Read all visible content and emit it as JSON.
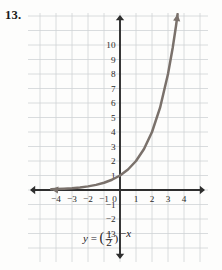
{
  "problem": {
    "number": "13."
  },
  "chart_data": {
    "type": "line",
    "title": "",
    "xlabel": "",
    "ylabel": "",
    "equation": "y = (1/2)^(-x)",
    "equation_parts": {
      "lhs": "y",
      "equals": "=",
      "open_paren": "(",
      "numerator": "1",
      "denominator": "2",
      "close_paren": ")",
      "exponent_sign": "−",
      "exponent_var": "x"
    },
    "xlim": [
      -4.6,
      5.0
    ],
    "ylim": [
      -4.6,
      11.4
    ],
    "grid": true,
    "grid_step": 1,
    "legend": "none",
    "x_ticks": [
      -4,
      -3,
      -2,
      -1,
      0,
      1,
      2,
      3,
      4
    ],
    "x_tick_labels": [
      "−4",
      "−3",
      "−2",
      "−1",
      "0",
      "1",
      "2",
      "3",
      "4"
    ],
    "y_ticks": [
      -3,
      -2,
      -1,
      1,
      2,
      3,
      4,
      5,
      6,
      7,
      8,
      9,
      10
    ],
    "y_tick_labels": [
      "−3",
      "−2",
      "−1",
      "1",
      "2",
      "3",
      "4",
      "5",
      "6",
      "7",
      "8",
      "9",
      "10"
    ],
    "series": [
      {
        "name": "y = (1/2)^(-x)",
        "x": [
          -4.3,
          -4,
          -3.5,
          -3,
          -2.5,
          -2,
          -1.5,
          -1,
          -0.5,
          0,
          0.5,
          1,
          1.5,
          2,
          2.5,
          3,
          3.3,
          3.5,
          3.6
        ],
        "values": [
          0.051,
          0.0625,
          0.088,
          0.125,
          0.177,
          0.25,
          0.354,
          0.5,
          0.707,
          1,
          1.414,
          2,
          2.828,
          4,
          5.657,
          8,
          9.85,
          11.31,
          12.13
        ],
        "color": "#7a716b",
        "arrow_start": true,
        "arrow_end": true
      }
    ],
    "colors": {
      "curve": "#7a716b",
      "grid": "#cfd3d6",
      "axis": "#2e2e2e",
      "text": "#23201e",
      "background": "#fdfdfc"
    }
  }
}
